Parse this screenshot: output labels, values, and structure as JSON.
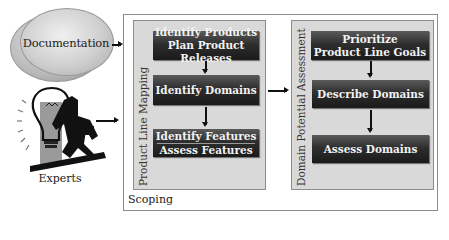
{
  "inputs": {
    "documentation": {
      "label": "Documentation",
      "icon": "documentation-ellipses-icon"
    },
    "experts": {
      "label": "Experts",
      "icon": "expert-lightbulb-icon"
    }
  },
  "scoping": {
    "label": "Scoping",
    "product_line_mapping": {
      "label": "Product Line Mapping",
      "steps": [
        {
          "lines": [
            "Identify Products",
            "Plan Product Releases"
          ]
        },
        {
          "lines": [
            "Identify Domains"
          ]
        },
        {
          "lines": [
            "Identify Features",
            "Assess Features"
          ]
        }
      ]
    },
    "domain_potential_assessment": {
      "label": "Domain Potential Assessment",
      "steps": [
        {
          "lines": [
            "Prioritize",
            "Product Line Goals"
          ]
        },
        {
          "lines": [
            "Describe Domains"
          ]
        },
        {
          "lines": [
            "Assess Domains"
          ]
        }
      ]
    }
  },
  "colors": {
    "box_dark": "#1a1a1a",
    "box_light": "#5a5a5a",
    "panel_bg": "#d9d9d9",
    "box_text": "#f2f2f2"
  }
}
